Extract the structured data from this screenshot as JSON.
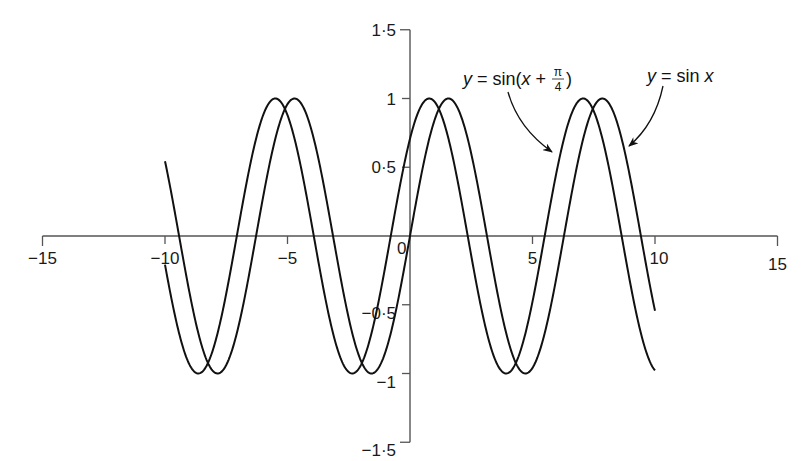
{
  "chart_data": {
    "type": "line",
    "title": "",
    "xlabel": "",
    "ylabel": "",
    "xlim": [
      -15,
      15
    ],
    "ylim": [
      -1.5,
      1.5
    ],
    "grid": false,
    "legend": "none (inline annotations with arrows)",
    "x_ticks": [
      -15,
      -10,
      -5,
      0,
      5,
      10,
      15
    ],
    "x_tick_labels": [
      "−15",
      "−10",
      "−5",
      "0",
      "5",
      "10",
      "15"
    ],
    "y_ticks": [
      1.5,
      1,
      0.5,
      -0.5,
      -1,
      -1.5
    ],
    "y_tick_labels": [
      "1·5",
      "1",
      "0·5",
      "−0·5",
      "−1",
      "−1·5"
    ],
    "series": [
      {
        "name": "y = sin x",
        "expression": "sin(x)",
        "x_range": [
          -10,
          10
        ],
        "phase": 0,
        "color": "#111111",
        "sample_points": [
          {
            "x": -10,
            "y": 0.544
          },
          {
            "x": -7.85,
            "y": -1
          },
          {
            "x": -4.71,
            "y": 1
          },
          {
            "x": -1.57,
            "y": -1
          },
          {
            "x": 0,
            "y": 0
          },
          {
            "x": 1.57,
            "y": 1
          },
          {
            "x": 4.71,
            "y": -1
          },
          {
            "x": 7.85,
            "y": 1
          },
          {
            "x": 10,
            "y": -0.544
          }
        ]
      },
      {
        "name": "y = sin(x + π/4)",
        "expression": "sin(x + pi/4)",
        "x_range": [
          -10,
          10
        ],
        "phase": 0.7853981634,
        "color": "#111111",
        "sample_points": [
          {
            "x": -10,
            "y": -0.197
          },
          {
            "x": -8.64,
            "y": -1
          },
          {
            "x": -5.5,
            "y": 1
          },
          {
            "x": -2.36,
            "y": -1
          },
          {
            "x": 0,
            "y": 0.707
          },
          {
            "x": 0.785,
            "y": 1
          },
          {
            "x": 3.93,
            "y": -1
          },
          {
            "x": 7.07,
            "y": 1
          },
          {
            "x": 10,
            "y": -0.977
          }
        ]
      }
    ],
    "annotations": [
      {
        "id": "shifted",
        "pre": "y",
        "mid": " = sin(",
        "var": "x",
        "plus": " +",
        "frac_num": "π",
        "frac_den": "4",
        "post": " )"
      },
      {
        "id": "base",
        "pre": "y",
        "mid": " = sin ",
        "var": "x"
      }
    ]
  }
}
